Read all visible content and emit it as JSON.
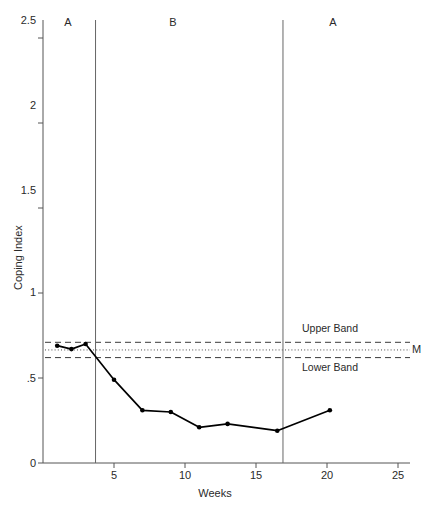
{
  "chart_data": {
    "type": "line",
    "title": "",
    "xlabel": "Weeks",
    "ylabel": "Coping Index",
    "xlim": [
      0,
      25
    ],
    "ylim": [
      0,
      2.5
    ],
    "grid": false,
    "legend_position": "none",
    "x": [
      1,
      2,
      3,
      5,
      7,
      9,
      11,
      13,
      16.5,
      20.2
    ],
    "values": [
      0.69,
      0.67,
      0.7,
      0.49,
      0.31,
      0.3,
      0.21,
      0.23,
      0.19,
      0.31
    ],
    "series": [
      {
        "name": "Coping Index",
        "x": [
          1,
          2,
          3,
          5,
          7,
          9,
          11,
          13,
          16.5,
          20.2
        ],
        "values": [
          0.69,
          0.67,
          0.7,
          0.49,
          0.31,
          0.3,
          0.21,
          0.23,
          0.19,
          0.31
        ],
        "marker": "filled-circle",
        "color": "#000000"
      }
    ],
    "xticks": [
      0,
      5,
      10,
      15,
      20,
      25
    ],
    "xticklabels": [
      "",
      "5",
      "10",
      "15",
      "20",
      "25"
    ],
    "yticks": [
      0,
      0.5,
      1,
      1.5,
      2,
      2.5
    ],
    "yticklabels": [
      "0",
      ".5",
      "1",
      "1.5",
      "2",
      "2.5"
    ],
    "reference_lines": [
      {
        "name": "Upper Band",
        "value": 0.71,
        "style": "dashed",
        "label": "Upper Band"
      },
      {
        "name": "Mean",
        "value": 0.665,
        "style": "dotted",
        "label": "M"
      },
      {
        "name": "Lower Band",
        "value": 0.62,
        "style": "dashed",
        "label": "Lower Band"
      }
    ],
    "phase_dividers": [
      3.7,
      16.9
    ],
    "phase_labels": [
      {
        "label": "A",
        "x": 1.75
      },
      {
        "label": "B",
        "x": 9.2
      },
      {
        "label": "A",
        "x": 20.5
      }
    ]
  },
  "axis": {
    "y_title": "Coping Index",
    "x_title": "Weeks",
    "ytick_0": "0",
    "ytick_1": ".5",
    "ytick_2": "1",
    "ytick_3": "1.5",
    "ytick_4": "2",
    "ytick_5": "2.5",
    "xtick_5": "5",
    "xtick_10": "10",
    "xtick_15": "15",
    "xtick_20": "20",
    "xtick_25": "25"
  },
  "annotations": {
    "upper_band": "Upper Band",
    "lower_band": "Lower Band",
    "mean_marker": "M",
    "phase_a1": "A",
    "phase_b": "B",
    "phase_a2": "A"
  }
}
